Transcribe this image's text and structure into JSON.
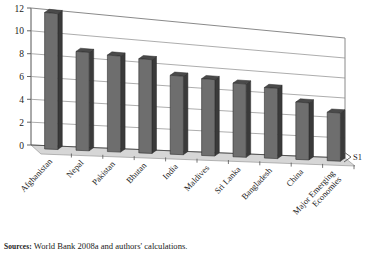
{
  "chart_data": {
    "type": "bar",
    "title": "",
    "subtitle": "",
    "xlabel": "",
    "ylabel": "",
    "ylim": [
      0,
      12
    ],
    "ytick_step": 2,
    "yticks": [
      "0",
      "2",
      "4",
      "6",
      "8",
      "10",
      "12"
    ],
    "grid": true,
    "three_d": true,
    "legend_position": "right",
    "legend": [
      "S1"
    ],
    "categories": [
      "Afghanistan",
      "Nepal",
      "Pakistan",
      "Bhutan",
      "India",
      "Maldives",
      "Sri Lanka",
      "Bangladesh",
      "China",
      "Major Emerging Economies"
    ],
    "series": [
      {
        "name": "S1",
        "values": [
          12.0,
          8.8,
          8.7,
          8.6,
          7.3,
          7.2,
          7.0,
          6.8,
          5.6,
          4.8
        ]
      }
    ]
  },
  "legend": {
    "series_label": "S1"
  },
  "source": {
    "lead": "Sources:",
    "text": "World Bank 2008a and authors' calculations."
  },
  "colors": {
    "bar_front": "#6e6e6e",
    "bar_side": "#3a3a3a",
    "bar_top": "#4a4a4a",
    "floor": "#d6d6d6",
    "axis": "#555555",
    "grid": "#8a8a8a",
    "text": "#1a1a1a",
    "background": "#ffffff"
  }
}
